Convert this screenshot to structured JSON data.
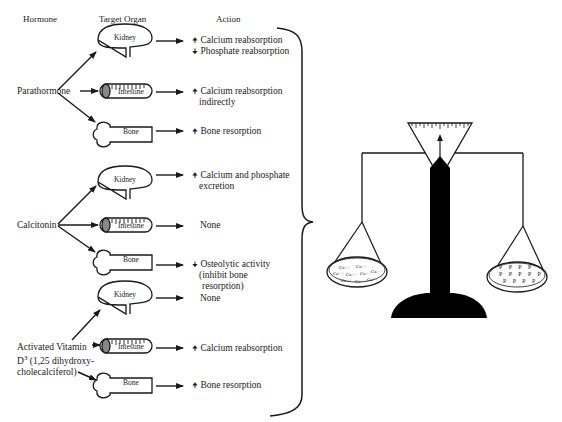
{
  "headers": {
    "hormone": "Hormone",
    "target_organ": "Target Organ",
    "action": "Action"
  },
  "hormones": [
    {
      "name": "Parathormone",
      "targets": [
        {
          "organ": "Kidney",
          "actions": [
            "Calcium reabsorption",
            "Phosphate reabsorption"
          ],
          "directions": [
            "up",
            "down"
          ]
        },
        {
          "organ": "Intestine",
          "actions": [
            "Calcium reabsorption",
            "indirectly"
          ],
          "directions": [
            "up",
            ""
          ]
        },
        {
          "organ": "Bone",
          "actions": [
            "Bone resorption"
          ],
          "directions": [
            "up"
          ]
        }
      ]
    },
    {
      "name": "Calcitonin",
      "targets": [
        {
          "organ": "Kidney",
          "actions": [
            "Calcium and phosphate",
            "excretion"
          ],
          "directions": [
            "up",
            ""
          ]
        },
        {
          "organ": "Intestine",
          "actions": [
            "None"
          ],
          "directions": [
            ""
          ]
        },
        {
          "organ": "Bone",
          "actions": [
            "Osteolytic activity",
            "(inhibit bone",
            "resorption)"
          ],
          "directions": [
            "down",
            "",
            ""
          ]
        }
      ]
    },
    {
      "name_lines": [
        "Activated Vitamin",
        "D",
        "3",
        " (1,25 dihydroxy-",
        "cholecalciferol)"
      ],
      "targets": [
        {
          "organ": "Kidney",
          "actions": [
            "None"
          ],
          "directions": [
            ""
          ]
        },
        {
          "organ": "Intestine",
          "actions": [
            "Calcium reabsorption"
          ],
          "directions": [
            "up"
          ]
        },
        {
          "organ": "Bone",
          "actions": [
            "Bone resorption"
          ],
          "directions": [
            "up"
          ]
        }
      ]
    }
  ],
  "balance": {
    "left_pan_ion": "Ca++",
    "right_pan_ion": "P"
  },
  "glyphs": {
    "up": "🠉",
    "down": "🠋"
  }
}
